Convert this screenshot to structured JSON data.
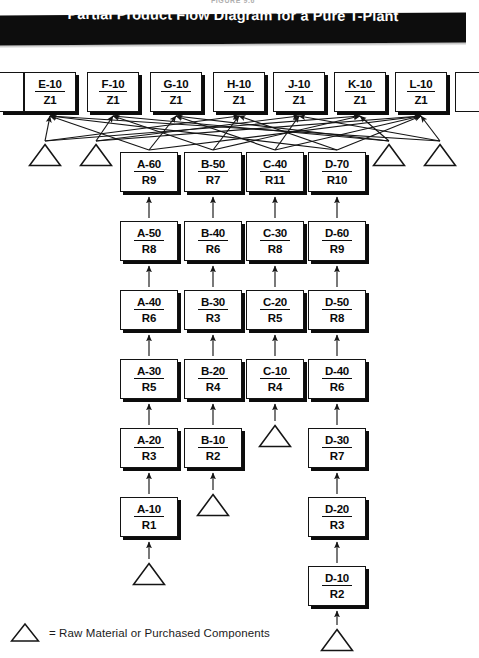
{
  "figure": {
    "caption": "FIGURE 9.6",
    "title": "Partial Product Flow Diagram for a Pure T-Plant"
  },
  "legend": {
    "symbol_name": "triangle-symbol",
    "text": "= Raw Material or Purchased Components"
  },
  "colors": {
    "banner_bg": "#0d0d0d",
    "banner_text": "#ffffff",
    "box_fill": "#ffffff",
    "box_stroke": "#131313",
    "box_shadow": "#0c0c0c",
    "arrow": "#151515"
  },
  "top_row": {
    "label": "End Item Z1 Row",
    "boxes": [
      {
        "part": "",
        "route": "",
        "x": 0,
        "y": 72,
        "w": 24,
        "h": 40,
        "clip": "left"
      },
      {
        "part": "E-10",
        "route": "Z1",
        "x": 24,
        "y": 72,
        "w": 52,
        "h": 40,
        "clip": "none"
      },
      {
        "part": "F-10",
        "route": "Z1",
        "x": 87,
        "y": 72,
        "w": 52,
        "h": 40,
        "clip": "none"
      },
      {
        "part": "G-10",
        "route": "Z1",
        "x": 150,
        "y": 72,
        "w": 52,
        "h": 40,
        "clip": "none"
      },
      {
        "part": "H-10",
        "route": "Z1",
        "x": 213,
        "y": 72,
        "w": 52,
        "h": 40,
        "clip": "none"
      },
      {
        "part": "J-10",
        "route": "Z1",
        "x": 273,
        "y": 72,
        "w": 52,
        "h": 40,
        "clip": "none"
      },
      {
        "part": "K-10",
        "route": "Z1",
        "x": 334,
        "y": 72,
        "w": 52,
        "h": 40,
        "clip": "none"
      },
      {
        "part": "L-10",
        "route": "Z1",
        "x": 395,
        "y": 72,
        "w": 52,
        "h": 40,
        "clip": "none"
      },
      {
        "part": "",
        "route": "",
        "x": 455,
        "y": 72,
        "w": 24,
        "h": 40,
        "clip": "right"
      }
    ]
  },
  "columns": [
    {
      "name": "A",
      "x": 120,
      "boxes": [
        {
          "part": "A-60",
          "route": "R9",
          "y": 152
        },
        {
          "part": "A-50",
          "route": "R8",
          "y": 221
        },
        {
          "part": "A-40",
          "route": "R6",
          "y": 290
        },
        {
          "part": "A-30",
          "route": "R5",
          "y": 359
        },
        {
          "part": "A-20",
          "route": "R3",
          "y": 428
        },
        {
          "part": "A-10",
          "route": "R1",
          "y": 497
        }
      ],
      "source_triangle_y": 562
    },
    {
      "name": "B",
      "x": 184,
      "boxes": [
        {
          "part": "B-50",
          "route": "R7",
          "y": 152
        },
        {
          "part": "B-40",
          "route": "R6",
          "y": 221
        },
        {
          "part": "B-30",
          "route": "R3",
          "y": 290
        },
        {
          "part": "B-20",
          "route": "R4",
          "y": 359
        },
        {
          "part": "B-10",
          "route": "R2",
          "y": 428
        }
      ],
      "source_triangle_y": 493
    },
    {
      "name": "C",
      "x": 246,
      "boxes": [
        {
          "part": "C-40",
          "route": "R11",
          "y": 152
        },
        {
          "part": "C-30",
          "route": "R8",
          "y": 221
        },
        {
          "part": "C-20",
          "route": "R5",
          "y": 290
        },
        {
          "part": "C-10",
          "route": "R4",
          "y": 359
        }
      ],
      "source_triangle_y": 424
    },
    {
      "name": "D",
      "x": 308,
      "boxes": [
        {
          "part": "D-70",
          "route": "R10",
          "y": 152
        },
        {
          "part": "D-60",
          "route": "R9",
          "y": 221
        },
        {
          "part": "D-50",
          "route": "R8",
          "y": 290
        },
        {
          "part": "D-40",
          "route": "R6",
          "y": 359
        },
        {
          "part": "D-30",
          "route": "R7",
          "y": 428
        },
        {
          "part": "D-20",
          "route": "R3",
          "y": 497
        },
        {
          "part": "D-10",
          "route": "R2",
          "y": 566
        }
      ],
      "source_triangle_y": 628
    }
  ],
  "feeder_triangles": [
    {
      "name": "feeder-triangle-1",
      "cx": 45,
      "y": 143
    },
    {
      "name": "feeder-triangle-2",
      "cx": 96,
      "y": 143
    },
    {
      "name": "feeder-triangle-3",
      "cx": 389,
      "y": 143
    },
    {
      "name": "feeder-triangle-4",
      "cx": 440,
      "y": 143
    }
  ],
  "box_size": {
    "w": 58,
    "h": 40
  },
  "triangle_size": {
    "w": 34,
    "h": 24
  }
}
